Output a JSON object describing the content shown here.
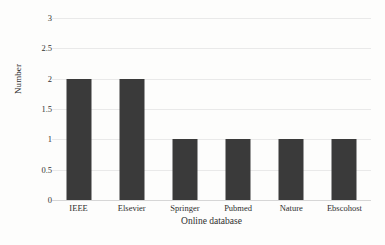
{
  "chart_data": {
    "type": "bar",
    "title": "",
    "subtitle": "",
    "xlabel": "Online database",
    "ylabel": "Number",
    "categories": [
      "IEEE",
      "Elsevier",
      "Springer",
      "Pubmed",
      "Nature",
      "Ebscohost"
    ],
    "values": [
      2,
      2,
      1,
      1,
      1,
      1
    ],
    "ylim": [
      0,
      3
    ],
    "yticks": [
      0,
      0.5,
      1,
      1.5,
      2,
      2.5,
      3
    ],
    "ytick_labels": [
      "0",
      "0.5",
      "1",
      "1.5",
      "2",
      "2.5",
      "3"
    ],
    "grid": true,
    "grid_axis": "y",
    "legend": false,
    "legend_position": "none",
    "bar_color": "#3a3a3a",
    "grid_color": "#e9e9e9",
    "axis_color": "#d6d6d6",
    "background_color": "#fdfdfc"
  }
}
